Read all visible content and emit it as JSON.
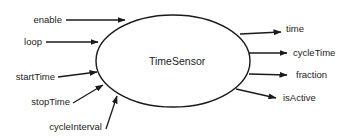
{
  "node": {
    "label": "TimeSensor",
    "stroke": "#1a1a1a",
    "fill": "#ffffff"
  },
  "inputs": [
    {
      "label": "enable"
    },
    {
      "label": "loop"
    },
    {
      "label": "startTime"
    },
    {
      "label": "stopTime"
    },
    {
      "label": "cycleInterval"
    }
  ],
  "outputs": [
    {
      "label": "time"
    },
    {
      "label": "cycleTime"
    },
    {
      "label": "fraction"
    },
    {
      "label": "isActive"
    }
  ],
  "colors": {
    "line": "#1a1a1a",
    "text": "#222222",
    "background": "#ffffff"
  }
}
